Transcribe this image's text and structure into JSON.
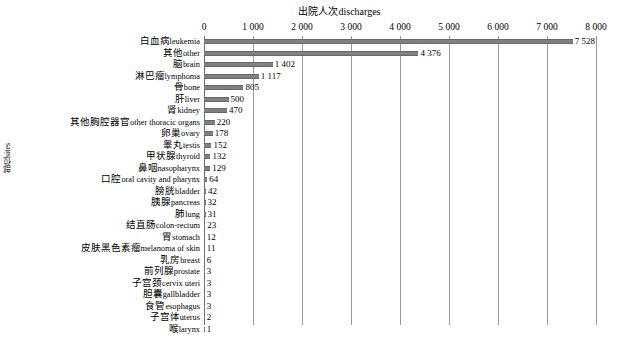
{
  "chart_title": "出院人次discharges",
  "y_axis_title": "部位sites",
  "x_axis": {
    "ticks": [
      "0",
      "1 000",
      "2 000",
      "3 000",
      "4 000",
      "5 000",
      "6 000",
      "7 000",
      "8 000"
    ],
    "min": 0,
    "max": 8000,
    "step": 1000
  },
  "colors": {
    "bar": "#808080",
    "bar_edge": "#676767",
    "gridline": "#9a9a9a",
    "text": "#000000",
    "background": "#ffffff"
  },
  "chart_data": {
    "type": "bar",
    "orientation": "horizontal",
    "title": "出院人次discharges",
    "xlabel": "出院人次discharges",
    "ylabel": "部位sites",
    "xlim": [
      0,
      8000
    ],
    "grid": true,
    "legend": "none",
    "categories": [
      "白血病leukemia",
      "其他other",
      "脑brain",
      "淋巴瘤lymphoma",
      "骨bone",
      "肝liver",
      "肾kidney",
      "其他胸腔器官other thoracic organs",
      "卵巢ovary",
      "睾丸testis",
      "甲状腺thyroid",
      "鼻咽nasopharynx",
      "口腔oral cavity and pharynx",
      "膀胱bladder",
      "胰腺pancreas",
      "肺lung",
      "结直肠colon-rectum",
      "胃stomach",
      "皮肤黑色素瘤melanoma of skin",
      "乳房breast",
      "前列腺prostate",
      "子宫颈cervix uteri",
      "胆囊gallbladder",
      "食管esophagus",
      "子宫体uterus",
      "喉larynx"
    ],
    "values": [
      7528,
      4376,
      1402,
      1117,
      805,
      500,
      470,
      220,
      178,
      152,
      132,
      129,
      64,
      42,
      32,
      31,
      23,
      12,
      11,
      6,
      3,
      3,
      3,
      3,
      2,
      1
    ],
    "value_labels": [
      "7 528",
      "4 376",
      "1 402",
      "1 117",
      "805",
      "500",
      "470",
      "220",
      "178",
      "152",
      "132",
      "129",
      "64",
      "42",
      "32",
      "31",
      "23",
      "12",
      "11",
      "6",
      "3",
      "3",
      "3",
      "3",
      "2",
      "1"
    ]
  },
  "rows": [
    {
      "cn": "白血病",
      "en": "leukemia",
      "value": 7528,
      "label": "7 528"
    },
    {
      "cn": "其他",
      "en": "other",
      "value": 4376,
      "label": "4 376"
    },
    {
      "cn": "脑",
      "en": "brain",
      "value": 1402,
      "label": "1 402"
    },
    {
      "cn": "淋巴瘤",
      "en": "lymphoma",
      "value": 1117,
      "label": "1 117"
    },
    {
      "cn": "骨",
      "en": "bone",
      "value": 805,
      "label": "805"
    },
    {
      "cn": "肝",
      "en": "liver",
      "value": 500,
      "label": "500"
    },
    {
      "cn": "肾",
      "en": "kidney",
      "value": 470,
      "label": "470"
    },
    {
      "cn": "其他胸腔器官",
      "en": "other thoracic organs",
      "value": 220,
      "label": "220"
    },
    {
      "cn": "卵巢",
      "en": "ovary",
      "value": 178,
      "label": "178"
    },
    {
      "cn": "睾丸",
      "en": "testis",
      "value": 152,
      "label": "152"
    },
    {
      "cn": "甲状腺",
      "en": "thyroid",
      "value": 132,
      "label": "132"
    },
    {
      "cn": "鼻咽",
      "en": "nasopharynx",
      "value": 129,
      "label": "129"
    },
    {
      "cn": "口腔",
      "en": "oral cavity and pharynx",
      "value": 64,
      "label": "64"
    },
    {
      "cn": "膀胱",
      "en": "bladder",
      "value": 42,
      "label": "42"
    },
    {
      "cn": "胰腺",
      "en": "pancreas",
      "value": 32,
      "label": "32"
    },
    {
      "cn": "肺",
      "en": "lung",
      "value": 31,
      "label": "31"
    },
    {
      "cn": "结直肠",
      "en": "colon-rectum",
      "value": 23,
      "label": "23"
    },
    {
      "cn": "胃",
      "en": "stomach",
      "value": 12,
      "label": "12"
    },
    {
      "cn": "皮肤黑色素瘤",
      "en": "melanoma of skin",
      "value": 11,
      "label": "11"
    },
    {
      "cn": "乳房",
      "en": "breast",
      "value": 6,
      "label": "6"
    },
    {
      "cn": "前列腺",
      "en": "prostate",
      "value": 3,
      "label": "3"
    },
    {
      "cn": "子宫颈",
      "en": "cervix uteri",
      "value": 3,
      "label": "3"
    },
    {
      "cn": "胆囊",
      "en": "gallbladder",
      "value": 3,
      "label": "3"
    },
    {
      "cn": "食管",
      "en": "esophagus",
      "value": 3,
      "label": "3"
    },
    {
      "cn": "子宫体",
      "en": "uterus",
      "value": 2,
      "label": "2"
    },
    {
      "cn": "喉",
      "en": "larynx",
      "value": 1,
      "label": "1"
    }
  ]
}
